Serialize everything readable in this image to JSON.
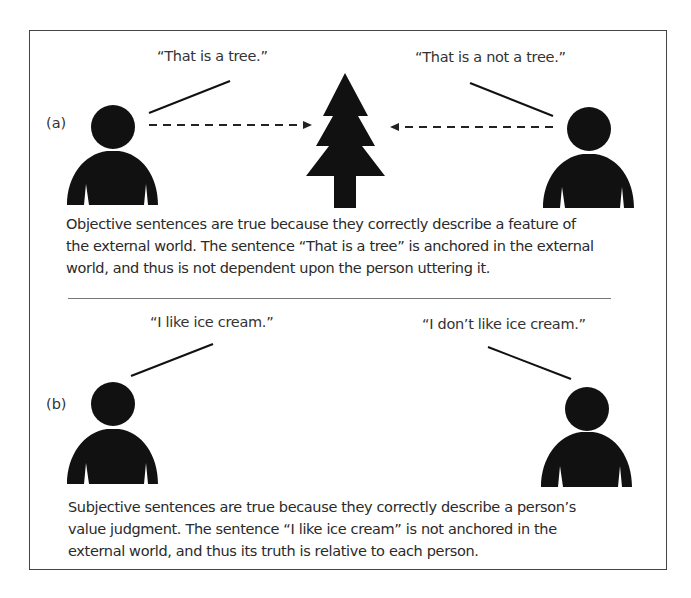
{
  "figure": {
    "panel_a": {
      "label": "(a)",
      "quote_left": "“That is a tree.”",
      "quote_right": "“That is a not a tree.”",
      "caption_lines": [
        "Objective sentences are true because they correctly describe a feature of",
        "the external world. The sentence “That is a tree” is anchored in the external",
        "world, and thus is not dependent upon the person uttering it."
      ]
    },
    "panel_b": {
      "label": "(b)",
      "quote_left": "“I like ice cream.”",
      "quote_right": "“I don’t like ice cream.”",
      "caption_lines": [
        "Subjective sentences are true because they correctly describe a person’s",
        "value judgment. The sentence “I like ice cream” is not anchored in the",
        "external world, and thus its truth is relative to each person."
      ]
    },
    "icons": [
      "person-icon",
      "tree-icon",
      "dashed-arrow-icon",
      "speech-line"
    ],
    "colors": {
      "ink": "#111111",
      "frame": "#444444",
      "text": "#2a2a2a"
    }
  }
}
